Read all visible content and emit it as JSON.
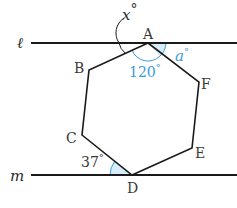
{
  "figure": {
    "lines": [
      {
        "name": "l",
        "label": "ℓ"
      },
      {
        "name": "m",
        "label": "m"
      }
    ],
    "vertices": [
      {
        "name": "A",
        "label": "A"
      },
      {
        "name": "B",
        "label": "B"
      },
      {
        "name": "C",
        "label": "C"
      },
      {
        "name": "D",
        "label": "D"
      },
      {
        "name": "E",
        "label": "E"
      },
      {
        "name": "F",
        "label": "F"
      }
    ],
    "angles": {
      "x": {
        "label": "x°",
        "var": "x",
        "deg": "°"
      },
      "a": {
        "label": "a°",
        "var": "a",
        "deg": "°"
      },
      "A_interior": {
        "label": "120°",
        "value": "120",
        "deg": "°"
      },
      "D_angle": {
        "label": "37°",
        "value": "37",
        "deg": "°"
      }
    },
    "colors": {
      "line": "#1a1a1a",
      "highlight": "#3a9ad9",
      "highlight_fill": "#d6ecf8",
      "text": "#3a3a3a"
    }
  }
}
